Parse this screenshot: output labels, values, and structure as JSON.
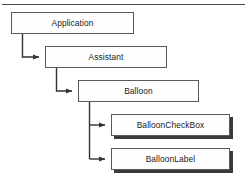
{
  "diagram": {
    "type": "hierarchy-tree",
    "top_rule": true,
    "style": {
      "box_fill": "#fefefe",
      "box_border": "#5a5a5a",
      "shadow_color": "#3a3a3a",
      "connector_color": "#333333",
      "text_color": "#1a1a1a",
      "background": "#ffffff"
    },
    "nodes": [
      {
        "id": "application",
        "label": "Application",
        "level": 0,
        "x": 11,
        "y": 12,
        "width": 123,
        "height": 22,
        "shadow": false
      },
      {
        "id": "assistant",
        "label": "Assistant",
        "level": 1,
        "x": 45,
        "y": 46,
        "width": 122,
        "height": 22,
        "shadow": false
      },
      {
        "id": "balloon",
        "label": "Balloon",
        "level": 2,
        "x": 78,
        "y": 80,
        "width": 121,
        "height": 22,
        "shadow": false
      },
      {
        "id": "balloon-check-box",
        "label": "BalloonCheckBox",
        "level": 3,
        "x": 111,
        "y": 114,
        "width": 119,
        "height": 22,
        "shadow": true
      },
      {
        "id": "balloon-label",
        "label": "BalloonLabel",
        "level": 3,
        "x": 111,
        "y": 148,
        "width": 119,
        "height": 22,
        "shadow": true
      }
    ],
    "connectors": [
      {
        "id": "application-to-assistant",
        "from": "application",
        "to": "assistant",
        "label": "",
        "path": "M 22.5 34 L 22.5 57 L 40 57",
        "arrow_at": [
          45,
          57
        ]
      },
      {
        "id": "assistant-to-balloon",
        "from": "assistant",
        "to": "balloon",
        "label": "",
        "path": "M 56.5 68 L 56.5 91 L 73 91",
        "arrow_at": [
          78,
          91
        ]
      },
      {
        "id": "balloon-to-checkbox",
        "from": "balloon",
        "to": "balloon-check-box",
        "label": "",
        "path": "M 89.5 102 L 89.5 125 L 106 125",
        "arrow_at": [
          111,
          125
        ]
      },
      {
        "id": "balloon-to-label",
        "from": "balloon",
        "to": "balloon-label",
        "label": "",
        "path": "M 89.5 125 L 89.5 159 L 106 159",
        "arrow_at": [
          111,
          159
        ]
      }
    ]
  }
}
